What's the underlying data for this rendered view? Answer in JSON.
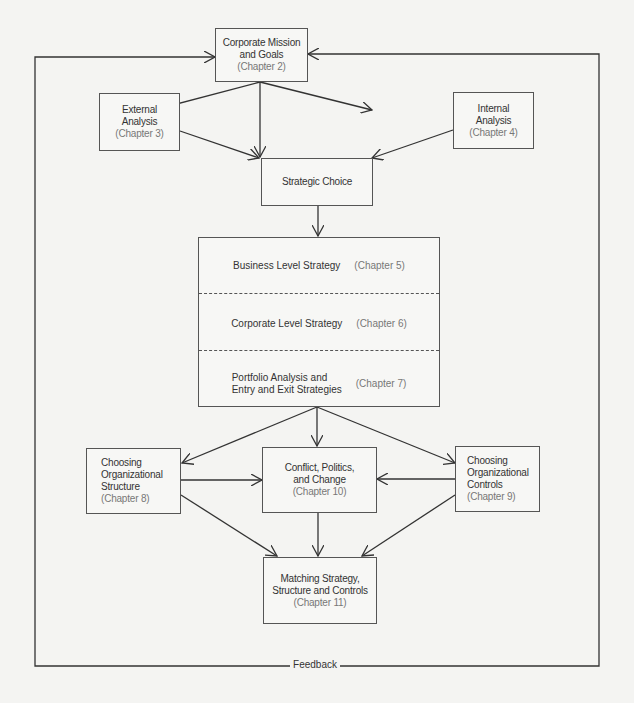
{
  "colors": {
    "line": "#333333",
    "box_border": "#555555",
    "text": "#333333",
    "chapter_text": "#777777",
    "background": "#f4f4f2"
  },
  "nodes": {
    "mission": {
      "line1": "Corporate Mission",
      "line2": "and Goals",
      "chapter": "(Chapter 2)"
    },
    "external": {
      "line1": "External",
      "line2": "Analysis",
      "chapter": "(Chapter 3)"
    },
    "internal": {
      "line1": "Internal",
      "line2": "Analysis",
      "chapter": "(Chapter 4)"
    },
    "strategic_choice": {
      "label": "Strategic Choice"
    },
    "strategy_levels": [
      {
        "label": "Business Level Strategy",
        "chapter": "(Chapter 5)"
      },
      {
        "label": "Corporate Level Strategy",
        "chapter": "(Chapter 6)"
      },
      {
        "line1": "Portfolio Analysis and",
        "line2": "Entry and Exit Strategies",
        "chapter": "(Chapter 7)"
      }
    ],
    "structure": {
      "line1": "Choosing",
      "line2": "Organizational",
      "line3": "Structure",
      "chapter": "(Chapter 8)"
    },
    "conflict": {
      "line1": "Conflict,  Politics,",
      "line2": "and Change",
      "chapter": "(Chapter 10)"
    },
    "controls": {
      "line1": "Choosing",
      "line2": "Organizational",
      "line3": "Controls",
      "chapter": "(Chapter 9)"
    },
    "matching": {
      "line1": "Matching Strategy,",
      "line2": "Structure and Controls",
      "chapter": "(Chapter 11)"
    }
  },
  "feedback_label": "Feedback"
}
